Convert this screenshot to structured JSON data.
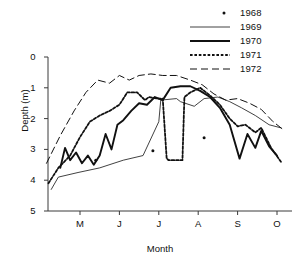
{
  "chart_data": {
    "type": "line",
    "title": "",
    "xlabel": "Month",
    "ylabel": "Depth (m)",
    "xlim": [
      3.6,
      10.3
    ],
    "ylim": [
      5,
      0
    ],
    "y_inverted": true,
    "grid": false,
    "legend_position": "top-right",
    "x_tick_labels": [
      "M",
      "J",
      "J",
      "A",
      "S",
      "O"
    ],
    "x_tick_values": [
      5,
      6,
      7,
      8,
      9,
      10
    ],
    "y_tick_labels": [
      "0",
      "1",
      "2",
      "3",
      "4",
      "5"
    ],
    "y_tick_values": [
      0,
      1,
      2,
      3,
      4,
      5
    ],
    "series": [
      {
        "name": "1968",
        "style": "scatter",
        "points": [
          {
            "x": 6.85,
            "y": 3.04
          },
          {
            "x": 8.15,
            "y": 2.62
          },
          {
            "x": 5.4,
            "y": 3.35
          }
        ]
      },
      {
        "name": "1969",
        "style": "thin-solid",
        "x": [
          4.27,
          4.45,
          4.95,
          5.5,
          6.1,
          6.6,
          7.0,
          7.05,
          7.45,
          7.55,
          7.9,
          8.15,
          8.5,
          8.8,
          9.1,
          9.45,
          9.8,
          10.1
        ],
        "y": [
          4.3,
          3.9,
          3.75,
          3.6,
          3.35,
          3.2,
          2.1,
          1.4,
          1.35,
          1.45,
          1.6,
          1.35,
          1.3,
          1.45,
          1.65,
          1.9,
          2.2,
          2.3
        ]
      },
      {
        "name": "1970",
        "style": "thick-solid",
        "x": [
          4.5,
          4.62,
          4.75,
          4.9,
          5.05,
          5.2,
          5.35,
          5.5,
          5.65,
          5.8,
          5.95,
          6.1,
          6.3,
          6.5,
          6.7,
          6.9,
          7.1,
          7.3,
          7.55,
          7.8,
          8.05,
          8.3,
          8.55,
          8.8,
          9.05,
          9.25,
          9.45,
          9.6,
          9.8,
          10.0
        ],
        "y": [
          3.6,
          2.95,
          3.35,
          3.1,
          3.45,
          3.2,
          3.5,
          3.2,
          2.5,
          3.0,
          2.2,
          2.05,
          1.75,
          1.5,
          1.55,
          1.3,
          1.4,
          1.0,
          0.95,
          0.95,
          1.1,
          1.3,
          1.65,
          2.2,
          3.3,
          2.5,
          2.95,
          2.4,
          2.9,
          3.2
        ]
      },
      {
        "name": "1971",
        "style": "dotted",
        "x": [
          4.2,
          4.45,
          4.75,
          5.0,
          5.25,
          5.5,
          5.75,
          6.0,
          6.2,
          6.45,
          6.65,
          6.75,
          6.95,
          7.1,
          7.2,
          7.25,
          7.6,
          7.65,
          7.8,
          8.05,
          8.3,
          8.55,
          8.8,
          9.0,
          9.2,
          9.45,
          9.6,
          9.85,
          10.1
        ],
        "y": [
          4.1,
          3.6,
          3.2,
          2.6,
          2.1,
          1.9,
          1.75,
          1.55,
          1.15,
          1.15,
          1.4,
          1.3,
          1.35,
          1.35,
          3.3,
          3.35,
          3.35,
          1.3,
          1.15,
          1.0,
          1.25,
          1.55,
          2.0,
          2.25,
          2.2,
          2.45,
          2.3,
          2.95,
          3.4
        ]
      },
      {
        "name": "1972",
        "style": "dashed",
        "x": [
          4.15,
          4.5,
          4.85,
          5.15,
          5.45,
          5.75,
          6.0,
          6.25,
          6.5,
          6.8,
          7.1,
          7.45,
          7.8,
          8.1,
          8.4,
          8.7,
          9.0,
          9.3,
          9.6,
          9.9,
          10.15
        ],
        "y": [
          3.45,
          2.55,
          1.75,
          1.15,
          0.75,
          0.85,
          0.6,
          0.75,
          0.6,
          0.55,
          0.6,
          0.6,
          0.75,
          0.9,
          1.2,
          1.4,
          1.35,
          1.5,
          1.7,
          2.1,
          2.35
        ]
      }
    ]
  },
  "legend": {
    "items": [
      {
        "label": "1968",
        "style": "scatter"
      },
      {
        "label": "1969",
        "style": "thin-solid"
      },
      {
        "label": "1970",
        "style": "thick-solid"
      },
      {
        "label": "1971",
        "style": "dotted"
      },
      {
        "label": "1972",
        "style": "dashed"
      }
    ]
  },
  "colors": {
    "axis": "#3a3a3a",
    "line": "#111111",
    "background": "#ffffff"
  }
}
